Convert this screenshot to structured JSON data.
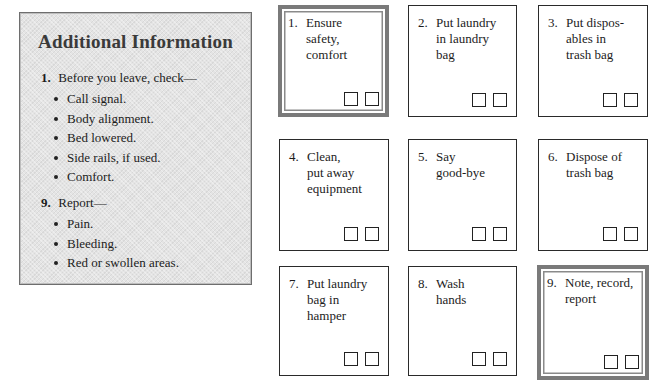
{
  "info_panel": {
    "title": "Additional Information",
    "sections": [
      {
        "number": "1.",
        "heading": "Before you leave, check—",
        "items": [
          "Call signal.",
          "Body alignment.",
          "Bed lowered.",
          "Side rails, if used.",
          "Comfort."
        ]
      },
      {
        "number": "9.",
        "heading": "Report—",
        "items": [
          "Pain.",
          "Bleeding.",
          "Red or swollen areas."
        ]
      }
    ]
  },
  "steps": [
    {
      "number": "1.",
      "label": "Ensure\nsafety,\ncomfort",
      "highlighted": true
    },
    {
      "number": "2.",
      "label": "Put laundry\nin laundry\nbag",
      "highlighted": false
    },
    {
      "number": "3.",
      "label": "Put dispos-\nables in\ntrash bag",
      "highlighted": false
    },
    {
      "number": "4.",
      "label": "Clean,\nput away\nequipment",
      "highlighted": false
    },
    {
      "number": "5.",
      "label": "Say\ngood-bye",
      "highlighted": false
    },
    {
      "number": "6.",
      "label": "Dispose of\ntrash bag",
      "highlighted": false
    },
    {
      "number": "7.",
      "label": "Put laundry\nbag in\nhamper",
      "highlighted": false
    },
    {
      "number": "8.",
      "label": "Wash\nhands",
      "highlighted": false
    },
    {
      "number": "9.",
      "label": "Note, record,\nreport",
      "highlighted": true
    }
  ],
  "colors": {
    "panel_background": "#e4e4e4",
    "panel_border": "#6e6e6e",
    "highlight_border": "#7a7a7a",
    "card_border": "#2a2a2a"
  }
}
